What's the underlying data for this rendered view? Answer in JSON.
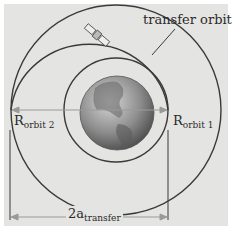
{
  "diagram": {
    "labels": {
      "transfer_orbit": "transfer orbit",
      "r_orbit2_main": "R",
      "r_orbit2_sub": "orbit 2",
      "r_orbit1_main": "R",
      "r_orbit1_sub": "orbit 1",
      "a_main": "2a",
      "a_sub": "transfer"
    },
    "elements": [
      "inner orbit (orbit 1)",
      "outer orbit (orbit 2)",
      "transfer orbit (half ellipse)",
      "Earth",
      "satellite"
    ],
    "colors": {
      "background": "#e4e4e2",
      "line": "#3a3a3a",
      "arrow": "#9a9a9a",
      "earth": "#8a8a8a"
    }
  }
}
